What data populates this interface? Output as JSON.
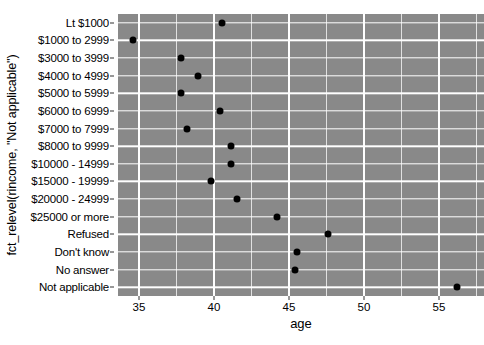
{
  "chart_data": {
    "type": "scatter",
    "title": "",
    "xlabel": "age",
    "ylabel": "fct_relevel(rincome, \"Not applicable\")",
    "xlim": [
      33.6,
      58.0
    ],
    "xticks": [
      35,
      40,
      45,
      50,
      55
    ],
    "xtick_labels": [
      "35",
      "40",
      "45",
      "50",
      "55"
    ],
    "xminor_ticks": [
      37.5,
      42.5,
      47.5,
      52.5,
      57.5
    ],
    "grid": true,
    "legend": "none",
    "panel_background": "#898989",
    "gridline_color": "#ffffff",
    "point_color": "#000000",
    "categories": [
      "Lt $1000",
      "$1000 to 2999",
      "$3000 to 3999",
      "$4000 to 4999",
      "$5000 to 5999",
      "$6000 to 6999",
      "$7000 to 7999",
      "$8000 to 9999",
      "$10000 - 14999",
      "$15000 - 19999",
      "$20000 - 24999",
      "$25000 or more",
      "Refused",
      "Don't know",
      "No answer",
      "Not applicable"
    ],
    "values": [
      40.5,
      34.6,
      37.8,
      38.9,
      37.8,
      40.4,
      38.2,
      41.1,
      41.1,
      39.8,
      41.5,
      44.2,
      47.6,
      45.5,
      45.4,
      56.2
    ],
    "points": [
      {
        "category": "Lt $1000",
        "age": 40.5
      },
      {
        "category": "$1000 to 2999",
        "age": 34.6
      },
      {
        "category": "$3000 to 3999",
        "age": 37.8
      },
      {
        "category": "$4000 to 4999",
        "age": 38.9
      },
      {
        "category": "$5000 to 5999",
        "age": 37.8
      },
      {
        "category": "$6000 to 6999",
        "age": 40.4
      },
      {
        "category": "$7000 to 7999",
        "age": 38.2
      },
      {
        "category": "$8000 to 9999",
        "age": 41.1
      },
      {
        "category": "$10000 - 14999",
        "age": 41.1
      },
      {
        "category": "$15000 - 19999",
        "age": 39.8
      },
      {
        "category": "$20000 - 24999",
        "age": 41.5
      },
      {
        "category": "$25000 or more",
        "age": 44.2
      },
      {
        "category": "Refused",
        "age": 47.6
      },
      {
        "category": "Don't know",
        "age": 45.5
      },
      {
        "category": "No answer",
        "age": 45.4
      },
      {
        "category": "Not applicable",
        "age": 56.2
      }
    ]
  }
}
